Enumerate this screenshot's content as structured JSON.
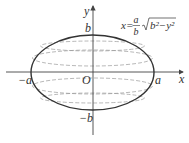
{
  "diagram": {
    "type": "ellipse-volume-of-revolution",
    "axes": {
      "x_label": "x",
      "y_label": "y",
      "origin_label": "O"
    },
    "labels": {
      "a_pos": "a",
      "a_neg": "−a",
      "b_pos": "b",
      "b_neg": "−b"
    },
    "formula": {
      "lhs": "x=",
      "frac_num": "a",
      "frac_den": "b",
      "radicand": "b²−y²"
    },
    "colors": {
      "curve": "#333333",
      "axis": "#444444",
      "dashed": "#999999"
    }
  }
}
